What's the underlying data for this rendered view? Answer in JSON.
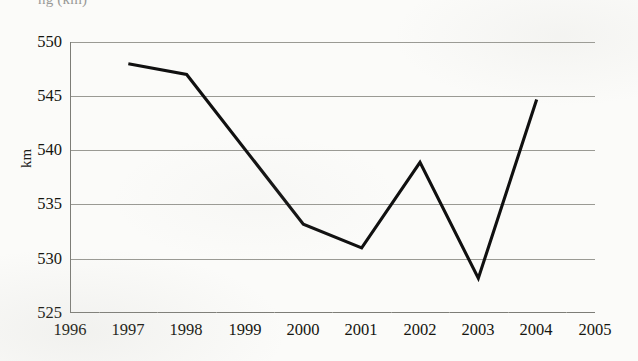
{
  "figure": {
    "title_partial": "ng (km)",
    "background_color": "#fbfbf9",
    "line_color": "#101010",
    "gridline_color": "#9a9a94",
    "axis_color": "#8d8d87"
  },
  "chart_data": {
    "type": "line",
    "title": "ng (km)",
    "xlabel": "",
    "ylabel": "km",
    "x": [
      1997,
      1998,
      2000,
      2001,
      2002,
      2003,
      2004
    ],
    "values": [
      548.0,
      547.0,
      533.2,
      531.0,
      538.9,
      528.2,
      544.7
    ],
    "series": [
      {
        "name": "km",
        "x": [
          1997,
          1998,
          2000,
          2001,
          2002,
          2003,
          2004
        ],
        "values": [
          548.0,
          547.0,
          533.2,
          531.0,
          538.9,
          528.2,
          544.7
        ]
      }
    ],
    "xlim": [
      1996,
      2005
    ],
    "ylim": [
      525,
      550
    ],
    "x_ticks": [
      1996,
      1997,
      1998,
      1999,
      2000,
      2001,
      2002,
      2003,
      2004,
      2005
    ],
    "y_ticks": [
      525,
      530,
      535,
      540,
      545,
      550
    ],
    "x_tick_labels": [
      "1996",
      "1997",
      "1998",
      "1999",
      "2000",
      "2001",
      "2002",
      "2003",
      "2004",
      "2005"
    ],
    "y_tick_labels": [
      "525",
      "530",
      "535",
      "540",
      "545",
      "550"
    ],
    "grid": "horizontal",
    "legend": "none",
    "markers": "none",
    "line_width": 3
  }
}
